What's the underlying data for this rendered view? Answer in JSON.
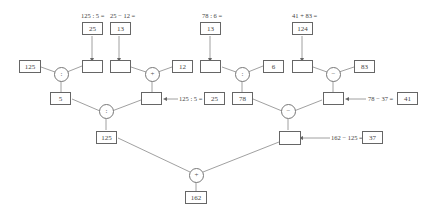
{
  "diagram": {
    "type": "calculation-tree",
    "top_labels": {
      "t1": "125 : 5 =",
      "t2": "25 − 12 =",
      "t3": "78 : 6 =",
      "t4": "41 + 83 ="
    },
    "top_boxes": {
      "t1": "25",
      "t2": "13",
      "t3": "13",
      "t4": "124"
    },
    "row2": {
      "left_125": "125",
      "blank_a": "",
      "blank_b": "",
      "right_12": "12",
      "blank_c": "",
      "right_6": "6",
      "blank_d": "",
      "right_83": "83"
    },
    "operators": {
      "op1": ":",
      "op2": "+",
      "op3": ":",
      "op4": "−",
      "op5": ":",
      "op6": "−",
      "op7": "+"
    },
    "row3": {
      "box_5": "5",
      "blank_e": "",
      "box_78": "78",
      "blank_f": ""
    },
    "side_hints": {
      "h1_label": "125 : 5 =",
      "h1_value": "25",
      "h2_label": "78 − 37 =",
      "h2_value": "41",
      "h3_label": "162 − 125 =",
      "h3_value": "37"
    },
    "row4": {
      "box_125": "125",
      "blank_g": ""
    },
    "result": "162"
  }
}
